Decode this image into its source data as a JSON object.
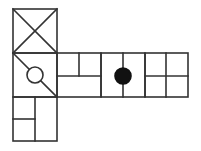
{
  "diagram": {
    "stroke_color": "#333333",
    "fill_color": "#111111",
    "background": "#ffffff",
    "cell_size": 44,
    "faces": [
      {
        "id": "top-left",
        "x": 13,
        "y": 9,
        "marking": "x-cross"
      },
      {
        "id": "middle-left",
        "x": 13,
        "y": 53,
        "marking": "diagonal-with-open-circle"
      },
      {
        "id": "bottom-left",
        "x": 13,
        "y": 97,
        "marking": "vertical-split-with-left-half-split"
      },
      {
        "id": "strip-1",
        "x": 57,
        "y": 53,
        "marking": "horizontal-split-top-half-split"
      },
      {
        "id": "strip-2",
        "x": 101,
        "y": 53,
        "marking": "vertical-split-with-filled-circle"
      },
      {
        "id": "strip-3",
        "x": 145,
        "y": 53,
        "marking": "four-quadrants"
      }
    ]
  }
}
